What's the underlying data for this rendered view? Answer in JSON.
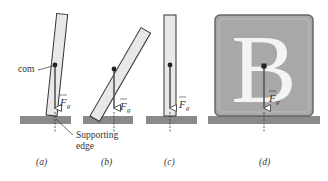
{
  "figure": {
    "panels": [
      {
        "id": "a",
        "caption": "(a)",
        "description": "Tilted block, com directly above supporting edge"
      },
      {
        "id": "b",
        "caption": "(b)",
        "description": "Block tilted further, com beyond supporting edge"
      },
      {
        "id": "c",
        "caption": "(c)",
        "description": "Upright narrow block"
      },
      {
        "id": "d",
        "caption": "(d)",
        "description": "Wide square block with letter B"
      }
    ],
    "labels": {
      "com": "com",
      "force_symbol": "F",
      "force_subscript": "g",
      "supporting_edge_line1": "Supporting",
      "supporting_edge_line2": "edge",
      "block_letter": "B"
    },
    "colors": {
      "block_fill": "#e8e8e8",
      "block_stroke": "#333333",
      "ground": "#8a8a8a",
      "big_block_fill": "#a8a8a8",
      "letter_fill": "#f4f4f4",
      "vector": "#555555",
      "com_dot": "#222222"
    }
  }
}
